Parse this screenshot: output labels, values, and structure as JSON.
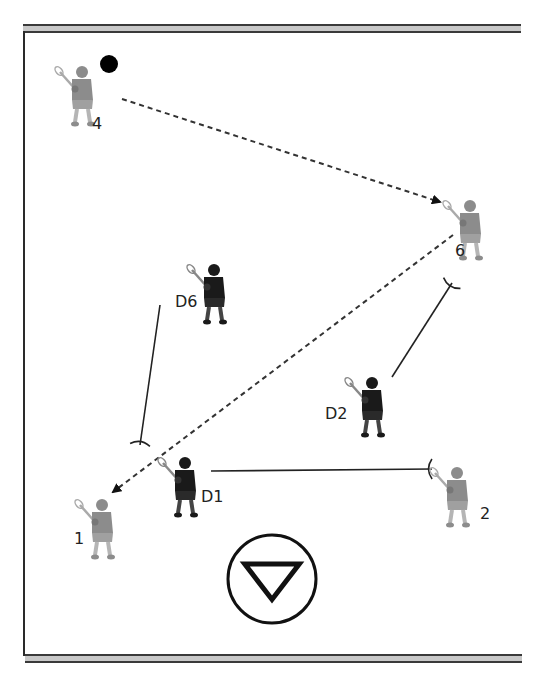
{
  "diagram": {
    "type": "lacrosse-play-diagram",
    "colors": {
      "offense": "#8a8a8a",
      "defense": "#1a1a1a",
      "line": "#222222",
      "band": "#c8c8c8"
    },
    "ball": {
      "x": 109,
      "y": 64
    },
    "goal": {
      "cx": 272,
      "cy": 579,
      "r": 44,
      "icon": "triangle-down-in-circle"
    },
    "offense": [
      {
        "id": "4",
        "label": "4",
        "x": 80,
        "y": 92,
        "lx": 92,
        "ly": 129
      },
      {
        "id": "6",
        "label": "6",
        "x": 468,
        "y": 226,
        "lx": 455,
        "ly": 256
      },
      {
        "id": "1",
        "label": "1",
        "x": 100,
        "y": 525,
        "lx": 74,
        "ly": 544
      },
      {
        "id": "2",
        "label": "2",
        "x": 455,
        "y": 493,
        "lx": 480,
        "ly": 519
      }
    ],
    "defense": [
      {
        "id": "D6",
        "label": "D6",
        "x": 212,
        "y": 290,
        "lx": 175,
        "ly": 307
      },
      {
        "id": "D2",
        "label": "D2",
        "x": 370,
        "y": 403,
        "lx": 325,
        "ly": 419
      },
      {
        "id": "D1",
        "label": "D1",
        "x": 183,
        "y": 483,
        "lx": 201,
        "ly": 502
      }
    ],
    "passes": [
      {
        "from": "4",
        "to": "6",
        "x1": 122,
        "y1": 99,
        "x2": 440,
        "y2": 202
      },
      {
        "from": "6",
        "to": "1",
        "x1": 453,
        "y1": 235,
        "x2": 113,
        "y2": 492
      }
    ],
    "approaches": [
      {
        "from": "D6",
        "to": "1",
        "x1": 160,
        "y1": 305,
        "x2": 140,
        "y2": 445
      },
      {
        "from": "D2",
        "to": "6",
        "x1": 392,
        "y1": 377,
        "x2": 452,
        "y2": 283
      },
      {
        "from": "D1",
        "to": "2",
        "x1": 211,
        "y1": 471,
        "x2": 432,
        "y2": 469
      }
    ]
  }
}
